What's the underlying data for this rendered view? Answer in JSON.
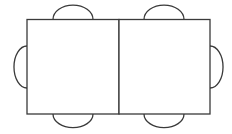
{
  "diagram": {
    "stroke_color": "#3a3a3a",
    "background_color": "#ffffff",
    "tables": [
      {
        "id": "table-left",
        "x": 27,
        "y": 19.5,
        "width": 92,
        "height": 94.5
      },
      {
        "id": "table-right",
        "x": 119,
        "y": 19.5,
        "width": 91,
        "height": 94.5
      }
    ],
    "chairs": [
      {
        "id": "chair-top-left",
        "side": "top",
        "cx": 73,
        "cy": 19.5,
        "r": 20
      },
      {
        "id": "chair-top-right",
        "side": "top",
        "cx": 164,
        "cy": 19.5,
        "r": 20
      },
      {
        "id": "chair-bottom-left",
        "side": "bottom",
        "cx": 73,
        "cy": 114,
        "r": 20
      },
      {
        "id": "chair-bottom-right",
        "side": "bottom",
        "cx": 164,
        "cy": 114,
        "r": 20
      },
      {
        "id": "chair-left",
        "side": "left",
        "cx": 27,
        "cy": 67,
        "r": 21
      },
      {
        "id": "chair-right",
        "side": "right",
        "cx": 210,
        "cy": 67,
        "r": 21
      }
    ]
  }
}
